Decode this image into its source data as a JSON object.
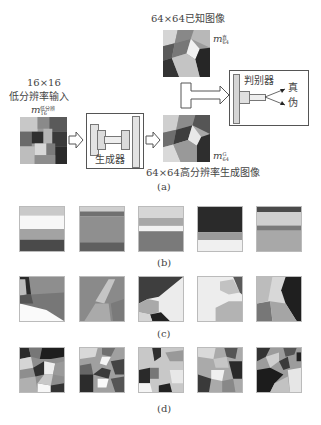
{
  "figure": {
    "panel_a": {
      "lr_input": {
        "size_label": "16×16",
        "title": "低分辨率输入",
        "symbol": "m",
        "symbol_sub": "16",
        "symbol_sup": "低分辨"
      },
      "generator_label": "生成器",
      "generated": {
        "caption": "64×64高分辨率生成图像",
        "symbol": "m",
        "symbol_sub": "64",
        "symbol_sup": "G"
      },
      "known": {
        "caption": "64×64已知图像",
        "symbol": "m",
        "symbol_sub": "64",
        "symbol_sup": "真"
      },
      "discriminator": {
        "label": "判别器",
        "output_real": "真",
        "output_fake": "伪"
      },
      "caption": "(a)"
    },
    "panel_b": {
      "caption": "(b)",
      "tiles": 5
    },
    "panel_c": {
      "caption": "(c)",
      "tiles": 5
    },
    "panel_d": {
      "caption": "(d)",
      "tiles": 5
    }
  },
  "colors": {
    "ink": "#444444",
    "box_border": "#555555",
    "fill_light": "#e6e6e6",
    "fill_mid": "#cfcfcf"
  }
}
